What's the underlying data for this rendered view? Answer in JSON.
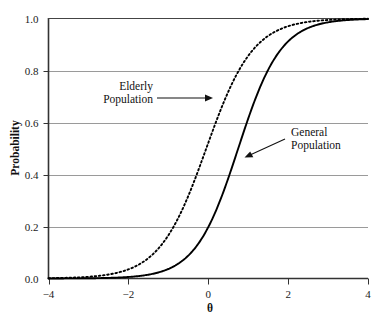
{
  "chart_data": {
    "type": "line",
    "title": "",
    "xlabel": "θ",
    "ylabel": "Probability",
    "xlim": [
      -4,
      4
    ],
    "ylim": [
      0.0,
      1.0
    ],
    "xticks": [
      "−4",
      "−2",
      "0",
      "2",
      "4"
    ],
    "xtick_values": [
      -4,
      -2,
      0,
      2,
      4
    ],
    "yticks": [
      "0.0",
      "0.2",
      "0.4",
      "0.6",
      "0.8",
      "1.0"
    ],
    "ytick_values": [
      0.0,
      0.2,
      0.4,
      0.6,
      0.8,
      1.0
    ],
    "grid": "horizontal",
    "legend_position": "inline-annotations",
    "series": [
      {
        "name": "Elderly Population",
        "style": "dotted",
        "color": "#000000",
        "model": "logistic",
        "location": -0.05,
        "slope": 1.0,
        "x": [
          -4,
          -3.5,
          -3,
          -2.5,
          -2,
          -1.5,
          -1,
          -0.5,
          0,
          0.5,
          1,
          1.5,
          2,
          2.5,
          3,
          3.5,
          4
        ],
        "y": [
          0.02,
          0.03,
          0.05,
          0.08,
          0.12,
          0.19,
          0.28,
          0.39,
          0.51,
          0.63,
          0.73,
          0.81,
          0.88,
          0.92,
          0.95,
          0.97,
          0.98
        ]
      },
      {
        "name": "General Population",
        "style": "solid",
        "color": "#000000",
        "model": "logistic",
        "location": 0.75,
        "slope": 1.1,
        "x": [
          -4,
          -3.5,
          -3,
          -2.5,
          -2,
          -1.5,
          -1,
          -0.5,
          0,
          0.5,
          1,
          1.5,
          2,
          2.5,
          3,
          3.5,
          4
        ],
        "y": [
          0.01,
          0.01,
          0.02,
          0.03,
          0.05,
          0.08,
          0.13,
          0.2,
          0.31,
          0.43,
          0.57,
          0.7,
          0.8,
          0.88,
          0.93,
          0.96,
          0.97
        ]
      }
    ],
    "annotations": [
      {
        "label_line1": "Elderly",
        "label_line2": "Population",
        "target_series": "Elderly Population",
        "arrow_direction": "right"
      },
      {
        "label_line1": "General",
        "label_line2": "Population",
        "target_series": "General Population",
        "arrow_direction": "left"
      }
    ]
  },
  "axes": {
    "y_title": "Probability",
    "x_title": "θ",
    "y_labels": [
      "1.0",
      "0.8",
      "0.6",
      "0.4",
      "0.2",
      "0.0"
    ],
    "x_labels": [
      "−4",
      "−2",
      "0",
      "2",
      "4"
    ]
  },
  "annotations": {
    "elderly": {
      "line1": "Elderly",
      "line2": "Population"
    },
    "general": {
      "line1": "General",
      "line2": "Population"
    }
  },
  "style": {
    "axis_color": "#333333",
    "grid_color": "#9a9a9a",
    "curve_color": "#000000",
    "background": "#ffffff"
  }
}
